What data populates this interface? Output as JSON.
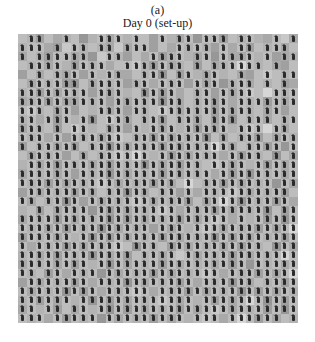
{
  "figure": {
    "panel_label": "(a)",
    "title": "Day 0 (set-up)"
  },
  "grid": {
    "columns": 32,
    "rows": 32,
    "agent_icon": "person-arrow-icon",
    "agent_color": "#2a2a2a",
    "gray_levels": [
      "#bdbdbd",
      "#b3b3b3",
      "#a9a9a9",
      "#a0a0a0",
      "#979797",
      "#c8c8c8",
      "#d6d6d6"
    ],
    "occupancy": [
      "01100100011101001011011101100101",
      "11101011011011100011110101101110",
      "10111111001100011110110111101011",
      "01111011110011111110101111110100",
      "00101110101100111011011001001011",
      "01111110111101101110111011101010",
      "11111111011100111100110111100111",
      "11111111110111111110111101111111",
      "11101100011101101111111111101100",
      "11011101101110111011101110111011",
      "11101011001101011101111101110110",
      "11101011111101111111110101110111",
      "10111110111111111111111110111101",
      "01111001011111101111111011110101",
      "01111111111111111111101111011111",
      "11111101111111111111110111111111",
      "11111111111111111101011111111011",
      "01111111101111101101011111111110",
      "11011110111111111111011111111110",
      "00101111011111111101111111111011",
      "11111111111111111111111101011111",
      "11111111111111101110111111111111",
      "11111101111111111111111111111111",
      "10111111111101110111111111110111",
      "11111111111110111101111111111111",
      "11111111011111111111111111011111",
      "11011011101111111111111011111111",
      "01111111011111111111011111101111",
      "11111111101111101111111111111111",
      "11111101111111111111011111111111",
      "11011011011111111111111111111111",
      "11101111101111111110111011111101"
    ],
    "shade": [
      "01302104102010030120400301012052",
      "10023501012520030201013020301020",
      "20130021450130203101204022010321",
      "01020130102005130210302106010230",
      "30201203010220104030120102305010",
      "02010340201031020103020410201032",
      "10302010302010403020103020506010",
      "21030220103020104020103020103020",
      "05102030102030105020103020102030",
      "10203010405020103010203040102010",
      "20103050102030102010302010506020",
      "01020301020501030201040201030201",
      "30102030104020103020106020103040",
      "02010302010506010302010203010402",
      "10203010203010402030105020103020",
      "20102030104020103020102030401020",
      "01030201050201030206010302010402",
      "30201030201040201030201050201030",
      "02010403020105020103020604010302",
      "10302010403020105020103020104030",
      "20103020104030201030205020103040",
      "01020301040201030201050201030206",
      "30102010403020103020104030201030",
      "02010302010504010302010203010402",
      "10203010402030102050201030201060",
      "20102030104020103020102030401020",
      "01030201040201030201050201030206",
      "30201030201040201030201040201030",
      "02010403020105020103020104030201",
      "10302010403020105020103020604030",
      "20103020104030201030205020103040",
      "01020301040201030201050206030201"
    ]
  }
}
